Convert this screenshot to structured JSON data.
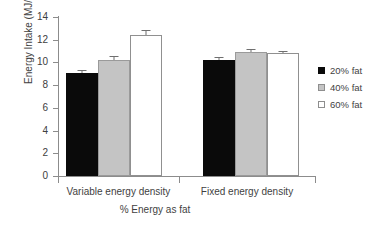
{
  "chart_data": {
    "type": "bar",
    "title": "",
    "xlabel": "% Energy as fat",
    "ylabel": "Energy Intake (MJ/d)",
    "ylim": [
      0,
      14
    ],
    "ytick_labels": [
      "0",
      "2",
      "4",
      "6",
      "8",
      "10",
      "12",
      "14"
    ],
    "ytick_values": [
      0,
      2,
      4,
      6,
      8,
      10,
      12,
      14
    ],
    "grid": false,
    "legend_position": "right",
    "categories": [
      "Variable energy density",
      "Fixed energy density"
    ],
    "series": [
      {
        "name": "20% fat",
        "color": "#0a0a0a",
        "values": [
          9.1,
          10.25
        ],
        "errors": [
          0.2,
          0.2
        ]
      },
      {
        "name": "40% fat",
        "color": "#c4c4c4",
        "values": [
          10.25,
          10.95
        ],
        "errors": [
          0.3,
          0.2
        ]
      },
      {
        "name": "60% fat",
        "color": "#ffffff",
        "values": [
          12.45,
          10.85
        ],
        "errors": [
          0.4,
          0.2
        ]
      }
    ]
  },
  "axes": {
    "y_title": "Energy Intake (MJ/d)",
    "x_title": "% Energy as fat",
    "y_ticks": [
      {
        "label": "14",
        "value": 14
      },
      {
        "label": "12",
        "value": 12
      },
      {
        "label": "10",
        "value": 10
      },
      {
        "label": "8",
        "value": 8
      },
      {
        "label": "6",
        "value": 6
      },
      {
        "label": "4",
        "value": 4
      },
      {
        "label": "2",
        "value": 2
      },
      {
        "label": "0",
        "value": 0
      }
    ],
    "groups": [
      {
        "label": "Variable energy density"
      },
      {
        "label": "Fixed energy density"
      }
    ]
  },
  "legend": {
    "items": [
      {
        "label": "20% fat",
        "swatch": "black"
      },
      {
        "label": "40% fat",
        "swatch": "gray"
      },
      {
        "label": "60% fat",
        "swatch": "white"
      }
    ]
  },
  "colors": {
    "series_20": "#0a0a0a",
    "series_40": "#c4c4c4",
    "series_60": "#ffffff",
    "axis": "#8c8c8c",
    "text": "#3f3f3f"
  }
}
